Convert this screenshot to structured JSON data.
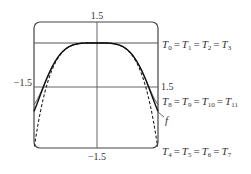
{
  "chart_data": {
    "type": "line",
    "title": "",
    "xlabel": "",
    "ylabel": "",
    "xlim": [
      -1.5,
      1.5
    ],
    "ylim": [
      -1.5,
      1.5
    ],
    "grid": false,
    "axes": {
      "x_axis_y": 0,
      "y_axis_x": 0
    },
    "tick_labels": {
      "top": "1.5",
      "bottom": "−1.5",
      "left": "−1.5",
      "right": "1.5"
    },
    "series": [
      {
        "name": "f",
        "label": "f",
        "style": "solid",
        "function": "cos(x^2)"
      },
      {
        "name": "T0=T1=T2=T3",
        "label_parts": [
          "T",
          "0",
          "T",
          "1",
          "T",
          "2",
          "T",
          "3"
        ],
        "style": "solid",
        "function": "1"
      },
      {
        "name": "T4=T5=T6=T7",
        "label_parts": [
          "T",
          "4",
          "T",
          "5",
          "T",
          "6",
          "T",
          "7"
        ],
        "style": "dashed",
        "function": "1 - x^4/2"
      },
      {
        "name": "T8=T9=T10=T11",
        "label_parts": [
          "T",
          "8",
          "T",
          "9",
          "T",
          "10",
          "T",
          "11"
        ],
        "style": "solid",
        "function": "1 - x^4/2 + x^8/24"
      }
    ],
    "annotations": [
      {
        "text": "T0 = T1 = T2 = T3",
        "position": "right, at y=1"
      },
      {
        "text": "T8 = T9 = T10 = T11",
        "position": "right, below axis"
      },
      {
        "text": "f",
        "position": "right, leader line to f"
      },
      {
        "text": "T4 = T5 = T6 = T7",
        "position": "right, bottom corner"
      }
    ]
  },
  "labels": {
    "top_tick": "1.5",
    "bottom_tick": "−1.5",
    "left_tick": "−1.5",
    "right_tick": "1.5",
    "f_label": "f",
    "eq": "=",
    "t0": {
      "T": "T",
      "sub": [
        "0",
        "1",
        "2",
        "3"
      ]
    },
    "t8": {
      "T": "T",
      "sub": [
        "8",
        "9",
        "10",
        "11"
      ]
    },
    "t4": {
      "T": "T",
      "sub": [
        "4",
        "5",
        "6",
        "7"
      ]
    }
  }
}
